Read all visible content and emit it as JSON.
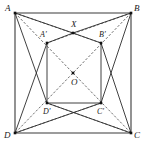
{
  "figure": {
    "type": "geometry-diagram",
    "canvas": {
      "width": 145,
      "height": 150
    },
    "colors": {
      "background": "#ffffff",
      "solid_line": "#2b2b2b",
      "outer_line": "#3a3a3a",
      "dashed_line": "#4a4a4a",
      "node": "#111111",
      "label": "#1a1a1a"
    },
    "points": [
      {
        "id": "A",
        "label": "A",
        "x": 15,
        "y": 13,
        "label_x": 5,
        "label_y": 11,
        "dot": true
      },
      {
        "id": "B",
        "label": "B",
        "x": 131,
        "y": 13,
        "label_x": 134,
        "label_y": 11,
        "dot": true
      },
      {
        "id": "C",
        "label": "C",
        "x": 131,
        "y": 133,
        "label_x": 134,
        "label_y": 138,
        "dot": true
      },
      {
        "id": "D",
        "label": "D",
        "x": 15,
        "y": 133,
        "label_x": 4,
        "label_y": 138,
        "dot": true
      },
      {
        "id": "X",
        "label": "X",
        "x": 73,
        "y": 33,
        "label_x": 71,
        "label_y": 27,
        "dot": true
      },
      {
        "id": "Ap",
        "label": "A'",
        "x": 47,
        "y": 43,
        "label_x": 40,
        "label_y": 37,
        "dot": true
      },
      {
        "id": "Bp",
        "label": "B'",
        "x": 101,
        "y": 43,
        "label_x": 99,
        "label_y": 37,
        "dot": true
      },
      {
        "id": "O",
        "label": "O",
        "x": 73,
        "y": 73,
        "label_x": 71,
        "label_y": 85,
        "dot": true
      },
      {
        "id": "Dp",
        "label": "D'",
        "x": 47,
        "y": 103,
        "label_x": 43,
        "label_y": 114,
        "dot": true
      },
      {
        "id": "Cp",
        "label": "C'",
        "x": 101,
        "y": 103,
        "label_x": 97,
        "label_y": 114,
        "dot": true
      }
    ],
    "outer_edges": [
      {
        "name": "side-AB",
        "from": "A",
        "to": "B"
      },
      {
        "name": "side-BC",
        "from": "B",
        "to": "C"
      },
      {
        "name": "side-CD",
        "from": "C",
        "to": "D"
      },
      {
        "name": "side-DA",
        "from": "D",
        "to": "A"
      }
    ],
    "solid_edges": [
      {
        "name": "segment-A-X",
        "from": "A",
        "to": "X"
      },
      {
        "name": "segment-X-B",
        "from": "X",
        "to": "B"
      },
      {
        "name": "segment-Ap-X",
        "from": "Ap",
        "to": "X"
      },
      {
        "name": "segment-X-Bp",
        "from": "X",
        "to": "Bp"
      },
      {
        "name": "segment-Ap-Dp",
        "from": "Ap",
        "to": "Dp"
      },
      {
        "name": "segment-Bp-Cp",
        "from": "Bp",
        "to": "Cp"
      },
      {
        "name": "segment-Dp-Cp",
        "from": "Dp",
        "to": "Cp"
      },
      {
        "name": "segment-A-Dp",
        "from": "A",
        "to": "Dp"
      },
      {
        "name": "segment-B-Cp",
        "from": "B",
        "to": "Cp"
      },
      {
        "name": "segment-D-Ap",
        "from": "D",
        "to": "Ap"
      },
      {
        "name": "segment-C-Bp",
        "from": "C",
        "to": "Bp"
      },
      {
        "name": "segment-D-Cp",
        "from": "D",
        "to": "Cp"
      },
      {
        "name": "segment-C-Dp",
        "from": "C",
        "to": "Dp"
      }
    ],
    "dashed_edges": [
      {
        "name": "diagonal-A-C",
        "from": "A",
        "to": "C"
      },
      {
        "name": "diagonal-B-D",
        "from": "B",
        "to": "D"
      },
      {
        "name": "segment-A-Bp",
        "from": "A",
        "to": "Bp"
      },
      {
        "name": "segment-B-Ap",
        "from": "B",
        "to": "Ap"
      },
      {
        "name": "segment-D-Cp2",
        "from": "D",
        "to": "Cp"
      },
      {
        "name": "segment-C-Dp2",
        "from": "C",
        "to": "Dp"
      }
    ]
  }
}
